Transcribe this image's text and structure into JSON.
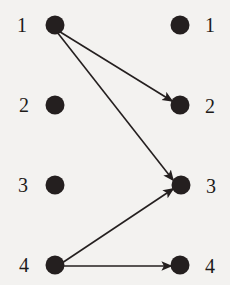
{
  "figure": {
    "width": 230,
    "height": 285,
    "background_color": "#f3f2f0",
    "ink_color": "#241f1f",
    "node_radius": 9.5
  },
  "chart_data": {
    "type": "diagram",
    "subtype": "bipartite-directed-graph",
    "title": "",
    "xlabel": "",
    "ylabel": "",
    "left_column": {
      "name": "domain",
      "nodes": [
        {
          "id": "L1",
          "label": "1",
          "x": 55,
          "y": 25,
          "label_x": 22,
          "label_y": 25
        },
        {
          "id": "L2",
          "label": "2",
          "x": 55,
          "y": 105,
          "label_x": 24,
          "label_y": 105
        },
        {
          "id": "L3",
          "label": "3",
          "x": 55,
          "y": 185,
          "label_x": 23,
          "label_y": 185
        },
        {
          "id": "L4",
          "label": "4",
          "x": 55,
          "y": 265,
          "label_x": 24,
          "label_y": 265
        }
      ]
    },
    "right_column": {
      "name": "codomain",
      "nodes": [
        {
          "id": "R1",
          "label": "1",
          "x": 180,
          "y": 25,
          "label_x": 210,
          "label_y": 25
        },
        {
          "id": "R2",
          "label": "2",
          "x": 180,
          "y": 105,
          "label_x": 210,
          "label_y": 106
        },
        {
          "id": "R3",
          "label": "3",
          "x": 181,
          "y": 185,
          "label_x": 211,
          "label_y": 186
        },
        {
          "id": "R4",
          "label": "4",
          "x": 180,
          "y": 265,
          "label_x": 210,
          "label_y": 266
        }
      ]
    },
    "edges": [
      {
        "id": "e1",
        "from": "L1",
        "to": "R2",
        "from_x": 57,
        "from_y": 30,
        "to_x": 172,
        "to_y": 101,
        "directed": true
      },
      {
        "id": "e2",
        "from": "L1",
        "to": "R3",
        "from_x": 57,
        "from_y": 32,
        "to_x": 173,
        "to_y": 180,
        "directed": true
      },
      {
        "id": "e3",
        "from": "L4",
        "to": "R3",
        "from_x": 62,
        "from_y": 263,
        "to_x": 173,
        "to_y": 189,
        "directed": true
      },
      {
        "id": "e4",
        "from": "L4",
        "to": "R4",
        "from_x": 60,
        "from_y": 266,
        "to_x": 171,
        "to_y": 266,
        "directed": true
      }
    ],
    "unconnected_nodes": [
      "L2",
      "L3",
      "R1"
    ],
    "legend": [],
    "annotations": [],
    "grid": false
  }
}
